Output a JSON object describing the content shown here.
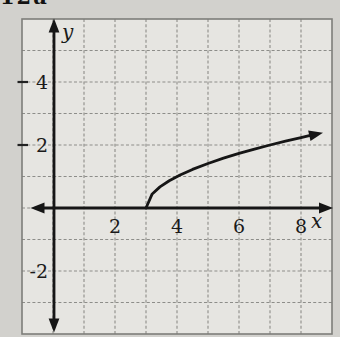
{
  "page": {
    "corner_label": "12a"
  },
  "colors": {
    "paper": "#d2d1cd",
    "grid_fill": "#e6e5e1",
    "grid_line": "#8d8d89",
    "frame_line": "#7e7e7a",
    "ink": "#161616"
  },
  "chart_data": {
    "type": "line",
    "title": "",
    "xlabel": "x",
    "ylabel": "y",
    "x_range": [
      -1,
      9
    ],
    "y_range": [
      -4,
      6
    ],
    "grid": "on",
    "legend": "none",
    "x_ticks": [
      {
        "value": 2,
        "label": "2"
      },
      {
        "value": 4,
        "label": "4"
      },
      {
        "value": 6,
        "label": "6"
      },
      {
        "value": 8,
        "label": "8"
      }
    ],
    "y_ticks": [
      {
        "value": 4,
        "label": "4",
        "frame_tick": true
      },
      {
        "value": 2,
        "label": "2",
        "frame_tick": true
      },
      {
        "value": -2,
        "label": "-2",
        "frame_tick": false
      }
    ],
    "series": [
      {
        "name": "y = sqrt(x - 3)",
        "arrow_end": true,
        "points": [
          [
            3,
            0
          ],
          [
            3.2,
            0.447
          ],
          [
            3.45,
            0.671
          ],
          [
            3.75,
            0.866
          ],
          [
            4.1,
            1.049
          ],
          [
            4.5,
            1.225
          ],
          [
            5,
            1.414
          ],
          [
            5.5,
            1.581
          ],
          [
            6,
            1.732
          ],
          [
            6.5,
            1.871
          ],
          [
            7,
            2
          ],
          [
            7.5,
            2.121
          ],
          [
            8,
            2.236
          ],
          [
            8.3,
            2.302
          ]
        ]
      }
    ]
  }
}
